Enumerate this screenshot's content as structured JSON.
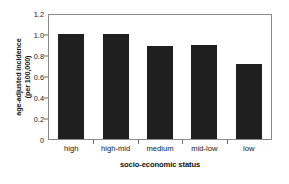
{
  "chart_data": {
    "type": "bar",
    "title": "",
    "subtitle": "",
    "xlabel": "socio-economic status",
    "ylabel_lines": [
      "age-adjusted incidence",
      "(per 100,000)"
    ],
    "ylabel": "age-adjusted incidence (per 100,000)",
    "categories": [
      "high",
      "high-mid",
      "medium",
      "mid-low",
      "low"
    ],
    "values": [
      1.02,
      1.02,
      0.9,
      0.91,
      0.73
    ],
    "ylim": [
      0,
      1.2
    ],
    "yticks": [
      0,
      0.2,
      0.4,
      0.6,
      0.8,
      1.0,
      1.2
    ],
    "ytick_labels": [
      "0",
      "0.2",
      "0.4",
      "0.6",
      "0.8",
      "1.0",
      "1.2"
    ],
    "grid": false,
    "legend": false,
    "legend_position": "none",
    "bar_color": "#1f1f1f",
    "frame_color": "#8a8a8a",
    "background_color": "#ffffff"
  }
}
